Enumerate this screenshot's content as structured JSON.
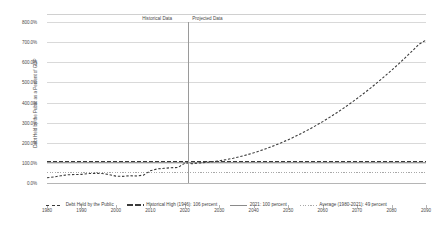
{
  "chart_data": {
    "type": "line",
    "title": "",
    "xlabel": "",
    "ylabel": "Debt Held by the Public as a Percent of GDP",
    "xlim": [
      1980,
      2090
    ],
    "ylim": [
      0,
      800
    ],
    "grid": true,
    "legend_position": "bottom",
    "x_ticks": [
      "1980",
      "1990",
      "2000",
      "2010",
      "2020",
      "2030",
      "2040",
      "2050",
      "2060",
      "2070",
      "2080",
      "2090"
    ],
    "y_ticks": [
      "0.0%",
      "100.0%",
      "200.0%",
      "300.0%",
      "400.0%",
      "500.0%",
      "600.0%",
      "700.0%",
      "800.0%"
    ],
    "annotations": [
      {
        "name": "historical-data-label",
        "text": "Historical Data"
      },
      {
        "name": "projected-data-label",
        "text": "Projected Data"
      },
      {
        "name": "divider-year",
        "value": 2021
      }
    ],
    "series": [
      {
        "name": "Debt Held by the Public",
        "style": "dashed",
        "x": [
          1980,
          1982,
          1984,
          1986,
          1988,
          1990,
          1992,
          1994,
          1996,
          1998,
          2000,
          2002,
          2004,
          2006,
          2008,
          2010,
          2012,
          2014,
          2016,
          2018,
          2020,
          2021,
          2022,
          2024,
          2026,
          2028,
          2030,
          2032,
          2034,
          2036,
          2038,
          2040,
          2042,
          2044,
          2046,
          2048,
          2050,
          2052,
          2054,
          2056,
          2058,
          2060,
          2062,
          2064,
          2066,
          2068,
          2070,
          2072,
          2074,
          2076,
          2078,
          2080,
          2082,
          2084,
          2086,
          2088,
          2090
        ],
        "values": [
          26,
          30,
          36,
          41,
          42,
          43,
          47,
          48,
          47,
          42,
          34,
          33,
          36,
          35,
          39,
          61,
          70,
          73,
          76,
          77,
          98,
          100,
          96,
          99,
          102,
          106,
          110,
          116,
          123,
          131,
          140,
          150,
          161,
          173,
          186,
          200,
          215,
          231,
          248,
          266,
          285,
          305,
          326,
          348,
          371,
          395,
          420,
          446,
          473,
          501,
          530,
          560,
          591,
          623,
          656,
          690,
          710
        ]
      },
      {
        "name": "Historical High (1946): 106 percent",
        "style": "heavy-dashed",
        "value": 106
      },
      {
        "name": "2021: 100 percent",
        "style": "solid",
        "value": 100
      },
      {
        "name": "Average (1980-2021): 49 percent",
        "style": "dotted",
        "value": 49
      }
    ]
  },
  "legend": {
    "items": [
      {
        "label": "Debt Held by the Public",
        "swatch": "dashed"
      },
      {
        "label": "Historical High (1946): 106 percent",
        "swatch": "heavy-dashed"
      },
      {
        "label": "2021: 100 percent",
        "swatch": "solid"
      },
      {
        "label": "Average (1980-2021): 49 percent",
        "swatch": "dotted"
      }
    ]
  },
  "colors": {
    "series": "#3a3a3a",
    "gridline": "#d9d9d9",
    "divider": "#9a9a9a",
    "reference_2021": "#9a9a9a",
    "reference_average": "#a8a8a8",
    "text": "#4a4a4a"
  }
}
